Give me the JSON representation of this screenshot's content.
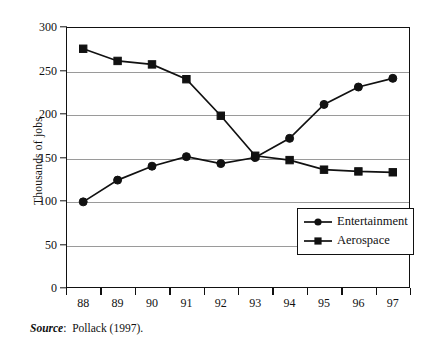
{
  "chart_data": {
    "type": "line",
    "title": "",
    "xlabel": "",
    "ylabel": "Thousands of jobs",
    "categories": [
      "88",
      "89",
      "90",
      "91",
      "92",
      "93",
      "94",
      "95",
      "96",
      "97"
    ],
    "x": [
      88,
      89,
      90,
      91,
      92,
      93,
      94,
      95,
      96,
      97
    ],
    "series": [
      {
        "name": "Entertainment",
        "marker": "circle",
        "values": [
          99,
          124,
          140,
          151,
          143,
          150,
          172,
          211,
          231,
          241
        ]
      },
      {
        "name": "Aerospace",
        "marker": "square",
        "values": [
          275,
          261,
          257,
          240,
          198,
          152,
          147,
          136,
          134,
          133
        ]
      }
    ],
    "ylim": [
      0,
      300
    ],
    "yticks": [
      0,
      50,
      100,
      150,
      200,
      250,
      300
    ],
    "ytick_labels": [
      "0",
      "50",
      "100",
      "150",
      "200",
      "250",
      "300"
    ],
    "grid": true,
    "grid_axis": "y",
    "legend_position": "lower-right",
    "line_color": "#111111",
    "grid_color": "#9a9a9a"
  },
  "legend": {
    "entries": [
      {
        "label": "Entertainment",
        "marker": "circle"
      },
      {
        "label": "Aerospace",
        "marker": "square"
      }
    ]
  },
  "source": {
    "word": "Source",
    "separator": ":",
    "text": "Pollack (1997)."
  }
}
